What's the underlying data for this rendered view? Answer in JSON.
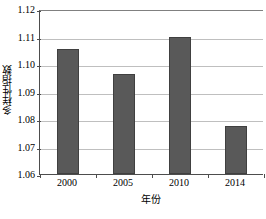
{
  "chart_data": {
    "type": "bar",
    "title": "",
    "categories": [
      "2000",
      "2005",
      "2010",
      "2014"
    ],
    "values": [
      1.1055,
      1.0963,
      1.11,
      1.0773
    ],
    "series": [
      {
        "name": "多样性指数",
        "values": [
          1.1055,
          1.0963,
          1.11,
          1.0773
        ]
      }
    ],
    "xlabel": "年份",
    "ylabel": "多样性指数",
    "ylim": [
      1.06,
      1.12
    ],
    "ytick_step": 0.01,
    "yticks": [
      1.06,
      1.07,
      1.08,
      1.09,
      1.1,
      1.11,
      1.12
    ],
    "ytick_labels": [
      "1.06",
      "1.07",
      "1.08",
      "1.09",
      "1.10",
      "1.11",
      "1.12"
    ],
    "grid": "horizontal",
    "legend": "none",
    "bar_color": "#595959",
    "bar_border_color": "#404040",
    "gridline_color": "#bfbfbf",
    "axis_color": "#4d4d4d",
    "background": "#ffffff"
  }
}
